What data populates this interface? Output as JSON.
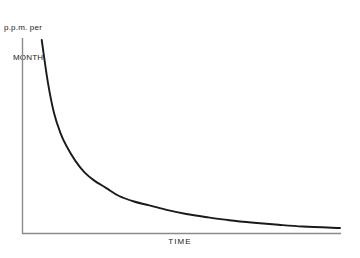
{
  "figure": {
    "background_color": "#ffffff",
    "axis_color": "#8a8a8a",
    "curve_color": "#1a1a1a"
  },
  "labels": {
    "ylabel_line1": "p.p.m. per",
    "ylabel_line2": "MONTH",
    "xlabel": "TIME"
  },
  "chart_data": {
    "type": "line",
    "title": "",
    "xlabel": "TIME",
    "ylabel": "p.p.m. per MONTH",
    "grid": false,
    "legend": null,
    "axis_ticks": false,
    "tick_labels": [],
    "xlim": [
      0,
      1
    ],
    "ylim": [
      0,
      1
    ],
    "series": [
      {
        "name": "decay",
        "x": [
          0.03,
          0.05,
          0.07,
          0.09,
          0.11,
          0.14,
          0.17,
          0.2,
          0.24,
          0.28,
          0.33,
          0.38,
          0.44,
          0.5,
          0.57,
          0.64,
          0.72,
          0.8,
          0.88,
          1.0
        ],
        "y": [
          1.0,
          0.78,
          0.62,
          0.52,
          0.45,
          0.37,
          0.31,
          0.27,
          0.23,
          0.19,
          0.16,
          0.14,
          0.115,
          0.095,
          0.078,
          0.063,
          0.05,
          0.039,
          0.03,
          0.022
        ]
      }
    ]
  }
}
